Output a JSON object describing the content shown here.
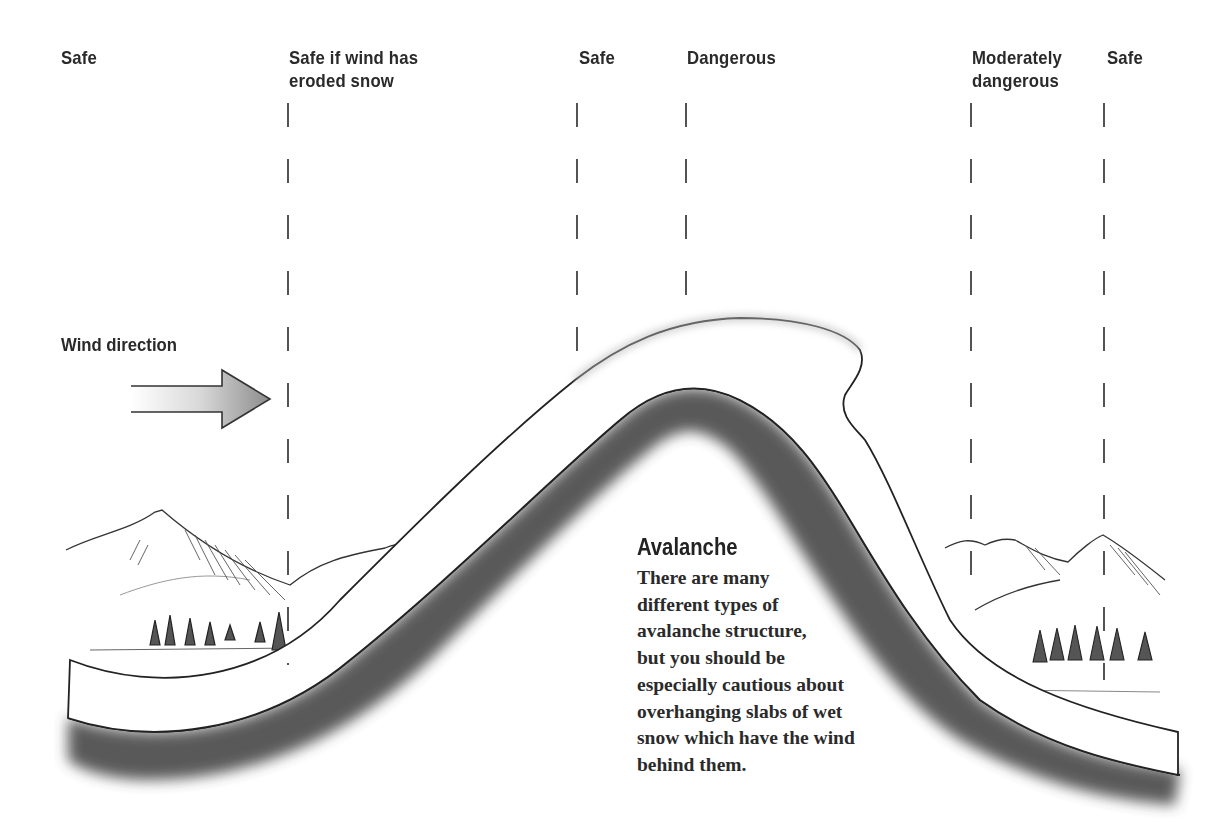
{
  "zones": [
    {
      "id": "safe-left",
      "lines": [
        "Safe"
      ]
    },
    {
      "id": "safe-if-wind-eroded",
      "lines": [
        "Safe if wind has",
        "eroded snow"
      ]
    },
    {
      "id": "safe-crest",
      "lines": [
        "Safe"
      ]
    },
    {
      "id": "dangerous",
      "lines": [
        "Dangerous"
      ]
    },
    {
      "id": "moderately-dangerous",
      "lines": [
        "Moderately",
        "dangerous"
      ]
    },
    {
      "id": "safe-right",
      "lines": [
        "Safe"
      ]
    }
  ],
  "wind": {
    "label": "Wind direction",
    "direction": "right",
    "arrow_icon": "arrow-right-icon"
  },
  "avalanche": {
    "title": "Avalanche",
    "body_lines": [
      "There are many",
      "different types of",
      "avalanche structure,",
      "but you should be",
      "especially cautious about",
      "overhanging slabs of wet",
      "snow which have the wind",
      "behind them."
    ]
  },
  "colors": {
    "ink": "#2a2a2a",
    "snow": "#ffffff",
    "rock_dark": "#3a3a3a",
    "arrow_fill": "#9a9a9a"
  }
}
